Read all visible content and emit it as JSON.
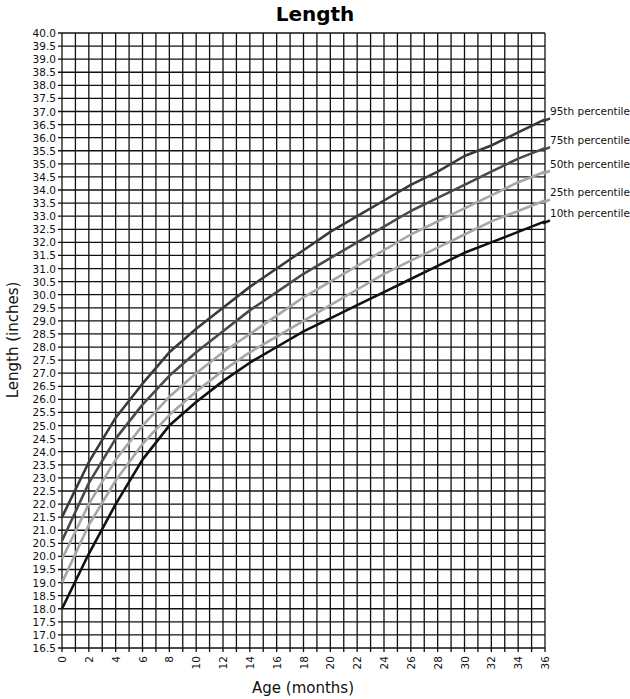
{
  "chart_data": {
    "type": "line",
    "title": "Length",
    "xlabel": "Age (months)",
    "ylabel": "Length (inches)",
    "xlim": [
      0,
      36
    ],
    "ylim": [
      16.5,
      40.0
    ],
    "grid": true,
    "x_ticks": [
      0,
      2,
      4,
      6,
      8,
      10,
      12,
      14,
      16,
      18,
      20,
      22,
      24,
      26,
      28,
      30,
      32,
      34,
      36
    ],
    "y_ticks": [
      16.5,
      17.0,
      17.5,
      18.0,
      18.5,
      19.0,
      19.5,
      20.0,
      20.5,
      21.0,
      21.5,
      22.0,
      22.5,
      23.0,
      23.5,
      24.0,
      24.5,
      25.0,
      25.5,
      26.0,
      26.5,
      27.0,
      27.5,
      28.0,
      28.5,
      29.0,
      29.5,
      30.0,
      30.5,
      31.0,
      31.5,
      32.0,
      32.5,
      33.0,
      33.5,
      34.0,
      34.5,
      35.0,
      35.5,
      36.0,
      36.5,
      37.0,
      37.5,
      38.0,
      38.5,
      39.0,
      39.5,
      40.0
    ],
    "legend_position": "right",
    "x": [
      0,
      2,
      4,
      6,
      8,
      10,
      12,
      14,
      16,
      18,
      20,
      22,
      24,
      26,
      28,
      30,
      32,
      34,
      36
    ],
    "series": [
      {
        "name": "95th percentile",
        "color": "#3a3a3a",
        "values": [
          21.5,
          23.6,
          25.3,
          26.6,
          27.8,
          28.7,
          29.5,
          30.3,
          31.0,
          31.7,
          32.4,
          33.0,
          33.6,
          34.2,
          34.7,
          35.3,
          35.7,
          36.2,
          36.7
        ]
      },
      {
        "name": "75th percentile",
        "color": "#4a4a4a",
        "values": [
          20.6,
          22.8,
          24.5,
          25.8,
          26.9,
          27.8,
          28.6,
          29.4,
          30.1,
          30.8,
          31.4,
          32.0,
          32.6,
          33.2,
          33.7,
          34.2,
          34.7,
          35.2,
          35.6
        ]
      },
      {
        "name": "50th percentile",
        "color": "#a6a6a6",
        "values": [
          19.9,
          22.0,
          23.7,
          25.0,
          26.1,
          27.0,
          27.8,
          28.5,
          29.2,
          29.9,
          30.5,
          31.1,
          31.7,
          32.3,
          32.8,
          33.3,
          33.8,
          34.3,
          34.7
        ]
      },
      {
        "name": "25th percentile",
        "color": "#a6a6a6",
        "values": [
          19.0,
          21.2,
          22.9,
          24.3,
          25.4,
          26.3,
          27.1,
          27.8,
          28.4,
          29.0,
          29.6,
          30.2,
          30.8,
          31.3,
          31.8,
          32.3,
          32.8,
          33.2,
          33.6
        ]
      },
      {
        "name": "10th percentile",
        "color": "#111111",
        "values": [
          18.0,
          20.1,
          22.0,
          23.7,
          25.0,
          25.9,
          26.7,
          27.4,
          28.0,
          28.6,
          29.1,
          29.6,
          30.1,
          30.6,
          31.1,
          31.6,
          32.0,
          32.4,
          32.8
        ]
      }
    ]
  }
}
